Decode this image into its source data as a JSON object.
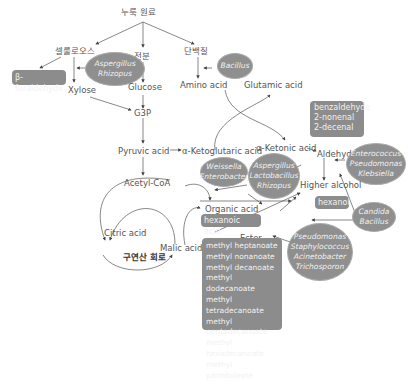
{
  "nodes": {
    "raw_material": "누룩 원료",
    "cellulose": "셀룰로오스",
    "starch": "전분",
    "protein": "단백질",
    "furaldehyde": "β-furaldehyde",
    "xylose": "Xylose",
    "glucose": "Glucose",
    "amino_acid": "Amino acid",
    "glutamic_acid": "Glutamic acid",
    "g3p": "G3P",
    "pyruvic_acid": "Pyruvic acid",
    "ketoglutaric_acid": "α-Ketoglutaric acid",
    "ketonic_acid": "α-Ketonic acid",
    "aldehyde": "Aldehyde",
    "acetyl_coa": "Acetyl-CoA",
    "higher_alcohol": "Higher alcohol",
    "organic_acid": "Organic acid",
    "citric_acid": "Citric acid",
    "malic_acid": "Malic acid",
    "tca_cycle": "구연산 회로",
    "ester": "Ester"
  },
  "boxes": {
    "furaldehyde": "β-furaldehyde",
    "aldehydes": [
      "benzaldehyde",
      "2-nonenal",
      "2-decenal"
    ],
    "hexanol": "hexanol",
    "hexanoic_acid": "hexanoic acid",
    "esters": [
      "methyl heptanoate",
      "methyl nonanoate",
      "methyl decanoate",
      "methyl dodecanoate",
      "methyl tetradecanoate",
      "methyl pentadecanoate",
      "methyl hexadecanoate",
      "methyl palmitoleate"
    ]
  },
  "microbes": {
    "aspergillus_rhizopus": [
      "Aspergillus",
      "Rhizopus"
    ],
    "bacillus": [
      "Bacillus"
    ],
    "weissella": [
      "Weissella",
      "Enterobacter"
    ],
    "aspergillus_lacto": [
      "Aspergillus",
      "Lactobacillus",
      "Rhizopus"
    ],
    "enterococcus": [
      "Enterococcus",
      "Pseudomonas",
      "Klebsiella"
    ],
    "candida": [
      "Candida",
      "Bacillus"
    ],
    "pseudomonas": [
      "Pseudomonas",
      "Staphylococcus",
      "Acinetobacter",
      "Trichosporon"
    ]
  },
  "colors": {
    "box": "#8c8c8c",
    "ellipse": "#8f8f8f",
    "line": "#555555"
  }
}
